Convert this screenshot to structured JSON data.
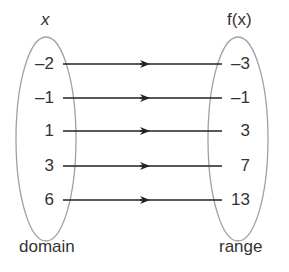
{
  "domain_header": "x",
  "range_header": "f(x)",
  "domain_label": "domain",
  "range_label": "range",
  "mappings": [
    {
      "x": "-2",
      "fx": "-3"
    },
    {
      "x": "-1",
      "fx": "-1"
    },
    {
      "x": "1",
      "fx": "3"
    },
    {
      "x": "3",
      "fx": "7"
    },
    {
      "x": "6",
      "fx": "13"
    }
  ],
  "colors": {
    "ellipse_stroke": "#a0a0a0",
    "arrow": "#222222",
    "text": "#333333"
  }
}
